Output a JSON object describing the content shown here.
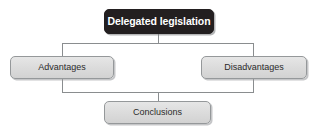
{
  "diagram": {
    "type": "flowchart",
    "orientation": "top-down",
    "title": "Delegated legislation",
    "nodes": [
      {
        "id": "root",
        "label": "Delegated legislation",
        "style": "dark",
        "level": 0
      },
      {
        "id": "advantages",
        "label": "Advantages",
        "style": "light",
        "level": 1
      },
      {
        "id": "disadvantages",
        "label": "Disadvantages",
        "style": "light",
        "level": 1
      },
      {
        "id": "conclusions",
        "label": "Conclusions",
        "style": "light",
        "level": 2
      }
    ],
    "edges": [
      {
        "from": "root",
        "to": "advantages"
      },
      {
        "from": "root",
        "to": "disadvantages"
      },
      {
        "from": "advantages",
        "to": "conclusions"
      },
      {
        "from": "disadvantages",
        "to": "conclusions"
      }
    ],
    "colors": {
      "root_fill": "#231f20",
      "root_text": "#ffffff",
      "node_fill": "#dcdcdc",
      "node_border": "#95989a",
      "node_text": "#2b2b2b",
      "connector": "#8a8d8f",
      "background": "#ffffff"
    }
  }
}
